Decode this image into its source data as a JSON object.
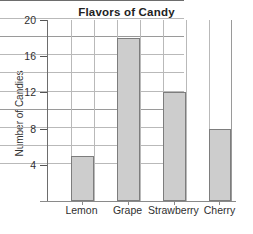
{
  "chart_data": {
    "type": "bar",
    "title": "Flavors of Candy",
    "xlabel": "",
    "ylabel": "Number of Candies",
    "categories": [
      "Lemon",
      "Grape",
      "Strawberry",
      "Cherry"
    ],
    "values": [
      5,
      18,
      12,
      8
    ],
    "ylim": [
      0,
      20
    ],
    "ytick_labels": [
      "20",
      "16",
      "12",
      "8",
      "4"
    ],
    "ytick_values": [
      20,
      16,
      12,
      8,
      4
    ],
    "minor_gridline_step": 2,
    "grid": true,
    "legend": "none",
    "bar_fill_color": "#cdcdcd",
    "bar_border_color": "#7d7d7d",
    "grid_color": "#b9b9b9",
    "axis_color": "#6d6d6d",
    "background_color": "#ffffff"
  }
}
